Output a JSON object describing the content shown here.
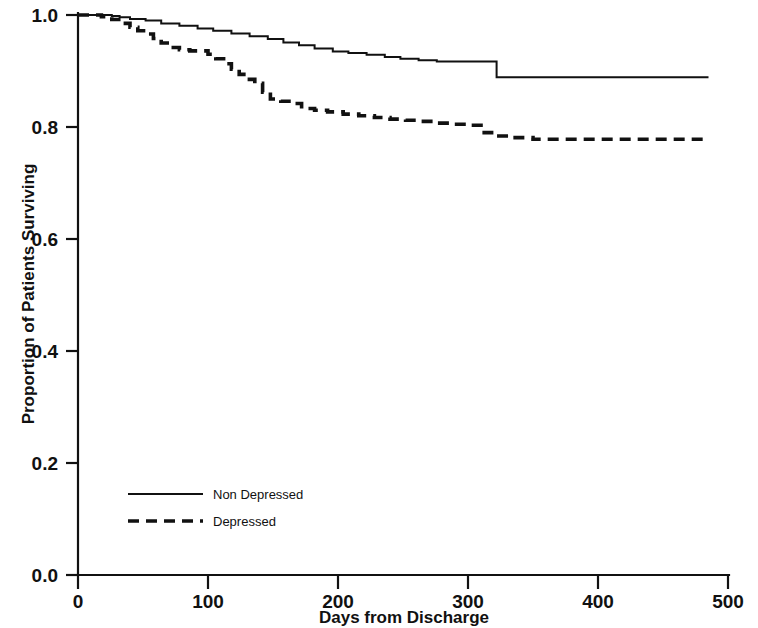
{
  "chart_data": {
    "type": "line",
    "subtype": "kaplan-meier-step",
    "title": "",
    "xlabel": "Days from Discharge",
    "ylabel": "Proportion of Patients Surviving",
    "xlim": [
      0,
      500
    ],
    "ylim": [
      0.0,
      1.0
    ],
    "xticks": [
      0,
      100,
      200,
      300,
      400,
      500
    ],
    "xtick_labels": [
      "0",
      "100",
      "200",
      "300",
      "400",
      "500"
    ],
    "yticks": [
      0.0,
      0.2,
      0.4,
      0.6,
      0.8,
      1.0
    ],
    "ytick_labels": [
      "0.0",
      "0.2",
      "0.4",
      "0.6",
      "0.8",
      "1.0"
    ],
    "grid": false,
    "legend_position": "lower-left-inside",
    "series": [
      {
        "name": "Non Depressed",
        "style": "solid",
        "color": "#111111",
        "x": [
          0,
          14,
          26,
          32,
          40,
          52,
          64,
          78,
          92,
          104,
          118,
          132,
          146,
          158,
          170,
          182,
          196,
          208,
          222,
          236,
          248,
          262,
          276,
          288,
          300,
          312,
          322,
          340,
          380,
          420,
          460,
          485
        ],
        "y": [
          1.0,
          1.0,
          0.998,
          0.996,
          0.993,
          0.99,
          0.985,
          0.981,
          0.976,
          0.972,
          0.967,
          0.962,
          0.957,
          0.951,
          0.946,
          0.94,
          0.935,
          0.932,
          0.929,
          0.925,
          0.922,
          0.919,
          0.917,
          0.917,
          0.917,
          0.917,
          0.889,
          0.889,
          0.889,
          0.889,
          0.889,
          0.889
        ]
      },
      {
        "name": "Depressed",
        "style": "dashed",
        "color": "#111111",
        "x": [
          0,
          10,
          18,
          26,
          34,
          40,
          46,
          52,
          58,
          64,
          70,
          78,
          86,
          94,
          100,
          106,
          112,
          118,
          124,
          130,
          136,
          142,
          148,
          156,
          164,
          172,
          182,
          192,
          204,
          216,
          228,
          240,
          252,
          264,
          276,
          288,
          300,
          310,
          320,
          334,
          350,
          380,
          420,
          460,
          485
        ],
        "y": [
          1.0,
          1.0,
          0.997,
          0.992,
          0.985,
          0.978,
          0.972,
          0.966,
          0.958,
          0.95,
          0.942,
          0.938,
          0.936,
          0.936,
          0.93,
          0.922,
          0.913,
          0.903,
          0.894,
          0.885,
          0.878,
          0.862,
          0.85,
          0.846,
          0.842,
          0.833,
          0.83,
          0.827,
          0.823,
          0.82,
          0.817,
          0.814,
          0.812,
          0.81,
          0.807,
          0.805,
          0.803,
          0.79,
          0.784,
          0.781,
          0.778,
          0.778,
          0.778,
          0.778,
          0.777
        ]
      }
    ],
    "annotations": []
  },
  "legend": {
    "entries": [
      {
        "label": "Non Depressed",
        "style": "solid"
      },
      {
        "label": "Depressed",
        "style": "dashed"
      }
    ]
  }
}
